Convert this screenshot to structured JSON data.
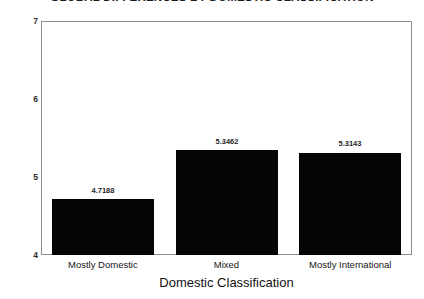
{
  "chart_data": {
    "type": "bar",
    "title": "GLOBAL DIFFERENCES BY DOMESTIC CLASSIFICATION",
    "xlabel": "Domestic Classification",
    "ylabel": "",
    "categories": [
      "Mostly Domestic",
      "Mixed",
      "Mostly International"
    ],
    "values": [
      4.7188,
      5.3462,
      5.3143
    ],
    "value_labels": [
      "4.7188",
      "5.3462",
      "5.3143"
    ],
    "ylim": [
      4,
      7
    ],
    "yticks": [
      4,
      5,
      6,
      7
    ],
    "ytick_labels": [
      "4",
      "5",
      "6",
      "7"
    ],
    "grid": false,
    "legend": null,
    "bar_color": "#050505",
    "frame_color": "#8d8d8d",
    "background": "#ffffff"
  }
}
